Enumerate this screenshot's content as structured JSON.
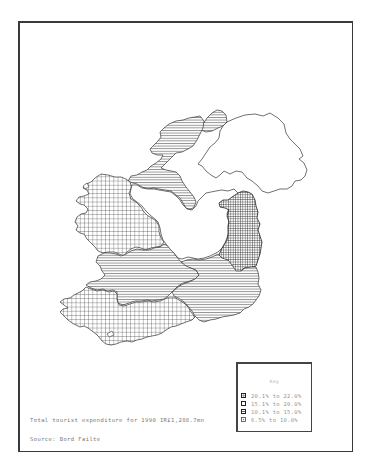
{
  "map": {
    "subject": "Regional share of tourist expenditure, Ireland",
    "regions": [
      {
        "name": "East",
        "class": "20.1% to 22.0%",
        "pattern": "dense-grid"
      },
      {
        "name": "West",
        "class": "15.1% to 20.0%",
        "pattern": "coarse-grid"
      },
      {
        "name": "South-West",
        "class": "15.1% to 20.0%",
        "pattern": "coarse-grid"
      },
      {
        "name": "North-West",
        "class": "10.1% to 15.0%",
        "pattern": "horizontal-lines"
      },
      {
        "name": "Donegal (north)",
        "class": "10.1% to 15.0%",
        "pattern": "horizontal-lines"
      },
      {
        "name": "Shannon",
        "class": "10.1% to 15.0%",
        "pattern": "horizontal-lines"
      },
      {
        "name": "South-East",
        "class": "10.1% to 15.0%",
        "pattern": "horizontal-lines"
      },
      {
        "name": "Midlands",
        "class": "6.5% to 10.0%",
        "pattern": "blank"
      },
      {
        "name": "Northern Ireland",
        "class": "not shaded",
        "pattern": "blank"
      }
    ]
  },
  "legend": {
    "title": "Key",
    "items": [
      {
        "label": "20.1% to 22.0%",
        "pattern": "dense-grid"
      },
      {
        "label": "15.1% to 20.0%",
        "pattern": "coarse-grid"
      },
      {
        "label": "10.1% to 15.0%",
        "pattern": "horizontal-lines"
      },
      {
        "label": "6.5% to 10.0%",
        "pattern": "dotted"
      }
    ]
  },
  "notes": {
    "total": "Total tourist expenditure for 1990 IR£1,288.7mn",
    "source": "Source: Bord Failte"
  },
  "colors": {
    "ink": "#333333",
    "text": "#888888",
    "background": "#ffffff"
  }
}
